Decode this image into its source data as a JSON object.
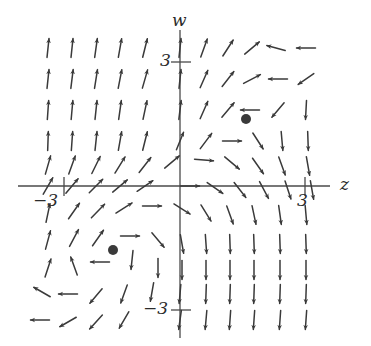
{
  "figure": {
    "kind": "direction-field",
    "title": "",
    "background_color": "#ffffff",
    "ink_color": "#3a3a3a",
    "axis_color": "#4a4a4a"
  },
  "axes": {
    "horizontal": {
      "name": "z-axis",
      "label": "z",
      "pixel_y": 186,
      "x_start": 18,
      "x_end": 330,
      "ticks": [
        {
          "label": "-3",
          "display": "−3",
          "value": -3,
          "pixel_x": 64
        },
        {
          "label": "3",
          "display": "3",
          "value": 3,
          "pixel_x": 305
        }
      ]
    },
    "vertical": {
      "name": "w-axis",
      "label": "w",
      "pixel_x": 180,
      "y_start": 30,
      "y_end": 338,
      "ticks": [
        {
          "label": "3",
          "display": "3",
          "value": 3,
          "pixel_y": 62
        },
        {
          "label": "-3",
          "display": "−3",
          "value": -3,
          "pixel_y": 310
        }
      ]
    }
  },
  "tick_labels": {
    "w_positive": "3",
    "w_negative": "−3",
    "z_positive": "3",
    "z_negative": "−3"
  },
  "chart_data": {
    "type": "scatter",
    "title": "",
    "xlabel": "z",
    "ylabel": "w",
    "xlim": [
      -5.4,
      6.4
    ],
    "ylim": [
      -5.9,
      5.1
    ],
    "grid": false,
    "legend": null,
    "equilibria": [
      {
        "name": "upper-right-equilibrium",
        "px": 246,
        "py": 119,
        "z": 1.7,
        "w": 1.8,
        "radius": 5
      },
      {
        "name": "lower-left-equilibrium",
        "px": 113,
        "py": 250,
        "z": -1.7,
        "w": -1.8,
        "radius": 5
      }
    ],
    "field": {
      "origin_px": [
        180,
        186
      ],
      "dx_px": 24.1,
      "dy_px": 30.8,
      "arrow_length_px": 19,
      "arrows": [
        {
          "px": 48,
          "py": 48,
          "angle": -84
        },
        {
          "px": 72,
          "py": 48,
          "angle": -84
        },
        {
          "px": 96,
          "py": 48,
          "angle": -82
        },
        {
          "px": 120,
          "py": 48,
          "angle": -80
        },
        {
          "px": 145,
          "py": 48,
          "angle": -76
        },
        {
          "px": 180,
          "py": 48,
          "angle": -84
        },
        {
          "px": 204,
          "py": 48,
          "angle": -70
        },
        {
          "px": 228,
          "py": 48,
          "angle": -57
        },
        {
          "px": 252,
          "py": 48,
          "angle": -40
        },
        {
          "px": 276,
          "py": 48,
          "angle": 195
        },
        {
          "px": 306,
          "py": 48,
          "angle": 180
        },
        {
          "px": 48,
          "py": 79,
          "angle": -84
        },
        {
          "px": 72,
          "py": 79,
          "angle": -83
        },
        {
          "px": 96,
          "py": 79,
          "angle": -81
        },
        {
          "px": 120,
          "py": 79,
          "angle": -79
        },
        {
          "px": 145,
          "py": 79,
          "angle": -74
        },
        {
          "px": 180,
          "py": 79,
          "angle": -84
        },
        {
          "px": 204,
          "py": 79,
          "angle": -66
        },
        {
          "px": 228,
          "py": 79,
          "angle": -52
        },
        {
          "px": 252,
          "py": 79,
          "angle": -28
        },
        {
          "px": 278,
          "py": 79,
          "angle": 180
        },
        {
          "px": 306,
          "py": 79,
          "angle": 145
        },
        {
          "px": 48,
          "py": 110,
          "angle": -86
        },
        {
          "px": 72,
          "py": 110,
          "angle": -85
        },
        {
          "px": 96,
          "py": 110,
          "angle": -84
        },
        {
          "px": 120,
          "py": 110,
          "angle": -82
        },
        {
          "px": 145,
          "py": 110,
          "angle": -78
        },
        {
          "px": 180,
          "py": 110,
          "angle": -83
        },
        {
          "px": 204,
          "py": 110,
          "angle": -66
        },
        {
          "px": 228,
          "py": 110,
          "angle": -50
        },
        {
          "px": 250,
          "py": 110,
          "angle": 180
        },
        {
          "px": 278,
          "py": 110,
          "angle": 130
        },
        {
          "px": 306,
          "py": 110,
          "angle": 93
        },
        {
          "px": 48,
          "py": 141,
          "angle": -88
        },
        {
          "px": 72,
          "py": 141,
          "angle": -86
        },
        {
          "px": 96,
          "py": 141,
          "angle": -84
        },
        {
          "px": 120,
          "py": 141,
          "angle": -80
        },
        {
          "px": 145,
          "py": 141,
          "angle": -76
        },
        {
          "px": 180,
          "py": 141,
          "angle": -68
        },
        {
          "px": 206,
          "py": 141,
          "angle": -53
        },
        {
          "px": 232,
          "py": 141,
          "angle": 0
        },
        {
          "px": 258,
          "py": 141,
          "angle": 57
        },
        {
          "px": 282,
          "py": 141,
          "angle": 85
        },
        {
          "px": 308,
          "py": 141,
          "angle": 88
        },
        {
          "px": 48,
          "py": 165,
          "angle": -74
        },
        {
          "px": 72,
          "py": 165,
          "angle": -70
        },
        {
          "px": 96,
          "py": 165,
          "angle": -64
        },
        {
          "px": 120,
          "py": 165,
          "angle": -58
        },
        {
          "px": 145,
          "py": 165,
          "angle": -52
        },
        {
          "px": 172,
          "py": 162,
          "angle": -40
        },
        {
          "px": 204,
          "py": 160,
          "angle": 5
        },
        {
          "px": 232,
          "py": 163,
          "angle": 40
        },
        {
          "px": 258,
          "py": 166,
          "angle": 55
        },
        {
          "px": 282,
          "py": 166,
          "angle": 70
        },
        {
          "px": 308,
          "py": 166,
          "angle": 80
        },
        {
          "px": 48,
          "py": 186,
          "angle": -60
        },
        {
          "px": 72,
          "py": 186,
          "angle": -50
        },
        {
          "px": 96,
          "py": 186,
          "angle": -45
        },
        {
          "px": 120,
          "py": 186,
          "angle": -40
        },
        {
          "px": 145,
          "py": 186,
          "angle": -34
        },
        {
          "px": 190,
          "py": 186,
          "angle": 0
        },
        {
          "px": 215,
          "py": 188,
          "angle": 35
        },
        {
          "px": 240,
          "py": 190,
          "angle": 52
        },
        {
          "px": 264,
          "py": 190,
          "angle": 62
        },
        {
          "px": 288,
          "py": 190,
          "angle": 72
        },
        {
          "px": 312,
          "py": 190,
          "angle": 80
        },
        {
          "px": 48,
          "py": 213,
          "angle": -78
        },
        {
          "px": 74,
          "py": 211,
          "angle": -55
        },
        {
          "px": 98,
          "py": 211,
          "angle": -46
        },
        {
          "px": 124,
          "py": 208,
          "angle": -32
        },
        {
          "px": 152,
          "py": 206,
          "angle": 0
        },
        {
          "px": 182,
          "py": 209,
          "angle": 32
        },
        {
          "px": 206,
          "py": 213,
          "angle": 58
        },
        {
          "px": 230,
          "py": 215,
          "angle": 70
        },
        {
          "px": 254,
          "py": 215,
          "angle": 78
        },
        {
          "px": 280,
          "py": 215,
          "angle": 82
        },
        {
          "px": 306,
          "py": 215,
          "angle": 85
        },
        {
          "px": 48,
          "py": 240,
          "angle": -75
        },
        {
          "px": 74,
          "py": 238,
          "angle": -62
        },
        {
          "px": 98,
          "py": 238,
          "angle": -55
        },
        {
          "px": 130,
          "py": 236,
          "angle": 0
        },
        {
          "px": 158,
          "py": 240,
          "angle": 50
        },
        {
          "px": 182,
          "py": 244,
          "angle": 80
        },
        {
          "px": 206,
          "py": 244,
          "angle": 86
        },
        {
          "px": 230,
          "py": 244,
          "angle": 88
        },
        {
          "px": 254,
          "py": 244,
          "angle": 88
        },
        {
          "px": 280,
          "py": 244,
          "angle": 88
        },
        {
          "px": 306,
          "py": 244,
          "angle": 88
        },
        {
          "px": 48,
          "py": 268,
          "angle": -72
        },
        {
          "px": 74,
          "py": 266,
          "angle": -110
        },
        {
          "px": 100,
          "py": 262,
          "angle": 180
        },
        {
          "px": 132,
          "py": 260,
          "angle": 96
        },
        {
          "px": 158,
          "py": 268,
          "angle": 90
        },
        {
          "px": 182,
          "py": 270,
          "angle": 90
        },
        {
          "px": 206,
          "py": 270,
          "angle": 90
        },
        {
          "px": 230,
          "py": 270,
          "angle": 90
        },
        {
          "px": 254,
          "py": 270,
          "angle": 90
        },
        {
          "px": 280,
          "py": 270,
          "angle": 90
        },
        {
          "px": 306,
          "py": 270,
          "angle": 90
        },
        {
          "px": 42,
          "py": 292,
          "angle": -150
        },
        {
          "px": 68,
          "py": 294,
          "angle": 180
        },
        {
          "px": 96,
          "py": 296,
          "angle": 130
        },
        {
          "px": 124,
          "py": 294,
          "angle": 110
        },
        {
          "px": 152,
          "py": 292,
          "angle": 100
        },
        {
          "px": 180,
          "py": 294,
          "angle": 95
        },
        {
          "px": 206,
          "py": 294,
          "angle": 92
        },
        {
          "px": 230,
          "py": 294,
          "angle": 92
        },
        {
          "px": 254,
          "py": 294,
          "angle": 92
        },
        {
          "px": 280,
          "py": 294,
          "angle": 92
        },
        {
          "px": 306,
          "py": 294,
          "angle": 92
        },
        {
          "px": 40,
          "py": 320,
          "angle": 180
        },
        {
          "px": 68,
          "py": 322,
          "angle": 150
        },
        {
          "px": 96,
          "py": 322,
          "angle": 132
        },
        {
          "px": 124,
          "py": 320,
          "angle": 120
        },
        {
          "px": 180,
          "py": 320,
          "angle": 98
        },
        {
          "px": 206,
          "py": 320,
          "angle": 95
        },
        {
          "px": 230,
          "py": 320,
          "angle": 94
        },
        {
          "px": 254,
          "py": 320,
          "angle": 94
        },
        {
          "px": 280,
          "py": 320,
          "angle": 94
        },
        {
          "px": 306,
          "py": 320,
          "angle": 94
        }
      ]
    }
  }
}
